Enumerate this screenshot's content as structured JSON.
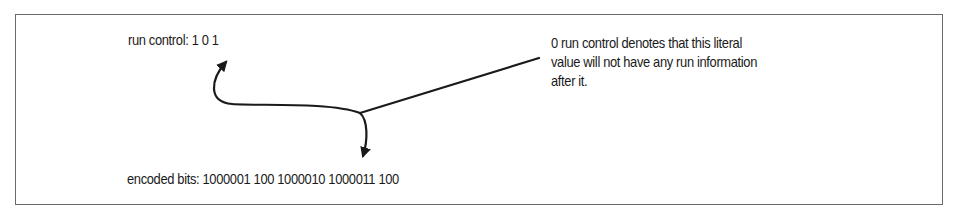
{
  "diagram": {
    "run_control": {
      "label": "run control:",
      "bits": "1 0 1",
      "text": "run control: 1 0 1"
    },
    "encoded_bits": {
      "label": "encoded bits:",
      "groups": [
        "1000001",
        "100",
        "1000010",
        "1000011",
        "100"
      ],
      "text": "encoded bits: 1000001 100 1000010 1000011 100"
    },
    "annotation": {
      "lines": [
        "0 run control denotes that this literal",
        "value will not have any run information",
        "after it."
      ]
    },
    "colors": {
      "frame": "#6a6a6a",
      "text": "#1a1a1a",
      "arrow": "#1a1a1a",
      "background": "#ffffff"
    },
    "icons": {
      "arrow_up": "curved-arrow-to-run-control",
      "arrow_down": "curved-arrow-to-encoded-bits",
      "leader_line": "callout-leader-line"
    }
  }
}
